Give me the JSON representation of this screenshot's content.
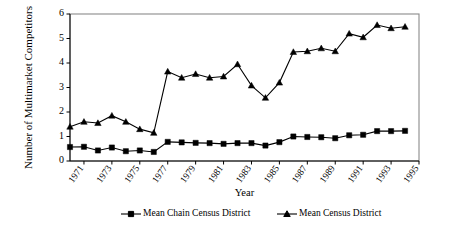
{
  "chart_data": {
    "type": "line",
    "title": "",
    "xlabel": "Year",
    "ylabel": "Number of Multimarket Competitors",
    "ylim": [
      0,
      6
    ],
    "xlim": [
      1970,
      1995
    ],
    "ytick_labels": [
      "6",
      "5",
      "4",
      "3",
      "2",
      "1",
      "0"
    ],
    "ytick_values": [
      6,
      5,
      4,
      3,
      2,
      1,
      0
    ],
    "xtick_labels": [
      "1971",
      "1973",
      "1975",
      "1977",
      "1979",
      "1981",
      "1983",
      "1985",
      "1987",
      "1989",
      "1991",
      "1993",
      "1995"
    ],
    "xtick_values": [
      1971,
      1973,
      1975,
      1977,
      1979,
      1981,
      1983,
      1985,
      1987,
      1989,
      1991,
      1993,
      1995
    ],
    "grid": false,
    "legend_position": "bottom",
    "x": [
      1970,
      1971,
      1972,
      1973,
      1974,
      1975,
      1976,
      1977,
      1978,
      1979,
      1980,
      1981,
      1982,
      1983,
      1984,
      1985,
      1986,
      1987,
      1988,
      1989,
      1990,
      1991,
      1992,
      1993,
      1994
    ],
    "series": [
      {
        "name": "Mean Chain Census District",
        "marker": "square",
        "color": "#000000",
        "values": [
          0.57,
          0.58,
          0.43,
          0.55,
          0.4,
          0.43,
          0.37,
          0.78,
          0.76,
          0.74,
          0.73,
          0.7,
          0.73,
          0.73,
          0.63,
          0.77,
          1.0,
          0.98,
          0.97,
          0.93,
          1.05,
          1.07,
          1.22,
          1.22,
          1.23
        ]
      },
      {
        "name": "Mean Census District",
        "marker": "triangle",
        "color": "#000000",
        "values": [
          1.4,
          1.6,
          1.55,
          1.85,
          1.6,
          1.3,
          1.15,
          3.65,
          3.4,
          3.55,
          3.4,
          3.45,
          3.95,
          3.08,
          2.58,
          3.2,
          4.45,
          4.48,
          4.6,
          4.48,
          5.2,
          5.05,
          5.55,
          5.42,
          5.48
        ]
      }
    ]
  },
  "axis": {
    "y_title": "Number of Multimarket Competitors",
    "x_title": "Year"
  },
  "legend": {
    "items": [
      {
        "label": "Mean Chain Census District",
        "marker": "square"
      },
      {
        "label": "Mean Census District",
        "marker": "triangle"
      }
    ]
  }
}
